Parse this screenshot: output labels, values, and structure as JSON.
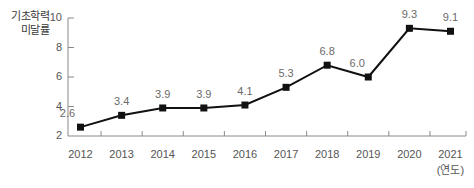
{
  "chart_data": {
    "type": "line",
    "title": "",
    "ylabel": "기초학력\n미달률",
    "xlabel": "(연도)",
    "categories": [
      "2012",
      "2013",
      "2014",
      "2015",
      "2016",
      "2017",
      "2018",
      "2019",
      "2020",
      "2021"
    ],
    "values": [
      2.6,
      3.4,
      3.9,
      3.9,
      4.1,
      5.3,
      6.8,
      6.0,
      9.3,
      9.1
    ],
    "point_labels": [
      "2.6",
      "3.4",
      "3.9",
      "3.9",
      "4.1",
      "5.3",
      "6.8",
      "6.0",
      "9.3",
      "9.1"
    ],
    "ylim": [
      2,
      10
    ],
    "ytick_labels": [
      "10",
      "8",
      "6",
      "4",
      "2"
    ],
    "ytick_values": [
      10,
      8,
      6,
      4,
      2
    ],
    "grid": false,
    "legend": "none",
    "series": [
      {
        "name": "기초학력 미달률",
        "values": [
          2.6,
          3.4,
          3.9,
          3.9,
          4.1,
          5.3,
          6.8,
          6.0,
          9.3,
          9.1
        ]
      }
    ],
    "colors": {
      "line": "#111111",
      "marker": "#111111",
      "axis": "#8a8a8a",
      "label_text": "#6a6a6a",
      "tick_text": "#555555",
      "title_text": "#3a3a3a",
      "background": "#ffffff"
    }
  }
}
